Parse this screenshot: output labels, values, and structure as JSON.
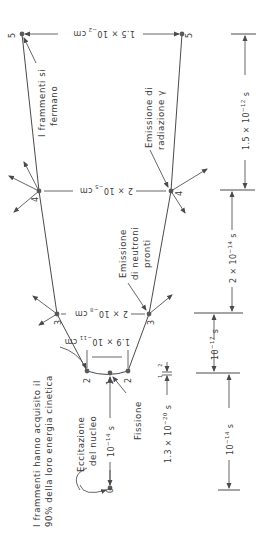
{
  "figure": {
    "orientation": "rotated 90 degrees clockwise (text reads bottom-to-top)",
    "nodes": [
      {
        "id": "0",
        "label": "0"
      },
      {
        "id": "1",
        "label": "1"
      },
      {
        "id": "2a",
        "label": "2"
      },
      {
        "id": "2b",
        "label": "2"
      },
      {
        "id": "3a",
        "label": "3"
      },
      {
        "id": "3b",
        "label": "3"
      },
      {
        "id": "4a",
        "label": "4"
      },
      {
        "id": "4b",
        "label": "4"
      },
      {
        "id": "5a",
        "label": "5"
      },
      {
        "id": "5b",
        "label": "5"
      }
    ],
    "annotations": {
      "fragments_energy_line1": "I frammenti hanno acquisito il",
      "fragments_energy_line2": "90% della loro energia cinetica",
      "excitation_line1": "Eccitazione",
      "excitation_line2": "del nucleo",
      "fission": "Fissione",
      "prompt_neutrons_line1": "Emissione",
      "prompt_neutrons_line2": "di neutroni",
      "prompt_neutrons_line3": "pronti",
      "gamma_line1": "Emissione di",
      "gamma_line2": "radiazione γ",
      "fragments_stop_line1": "I frammenti si",
      "fragments_stop_line2": "fermano"
    },
    "distances": {
      "d2": {
        "mant": "1.9 × 10",
        "exp": "−11",
        "unit": "cm"
      },
      "d3": {
        "mant": "2 × 10",
        "exp": "−8",
        "unit": "cm"
      },
      "d4": {
        "mant": "2 × 10",
        "exp": "−5",
        "unit": "cm"
      },
      "d5": {
        "mant": "1.5 × 10",
        "exp": "−2",
        "unit": "cm"
      }
    },
    "times": {
      "t01": {
        "mant": "10",
        "exp": "−14",
        "unit": "s"
      },
      "t12": {
        "mant": "1.3 × 10",
        "exp": "−20",
        "unit": "s"
      },
      "t12_marks": {
        "a": "1",
        "b": "2"
      },
      "t23": {
        "mant": "10",
        "exp": "−17",
        "unit": "s"
      },
      "t_0_to_2": {
        "mant": "10",
        "exp": "−14",
        "unit": "s"
      },
      "t34": {
        "mant": "2 × 10",
        "exp": "−14",
        "unit": "s"
      },
      "t45": {
        "mant": "1.5 × 10",
        "exp": "−12",
        "unit": "s"
      }
    },
    "colors": {
      "ink": "#3a3a3a",
      "background": "#ffffff"
    }
  }
}
